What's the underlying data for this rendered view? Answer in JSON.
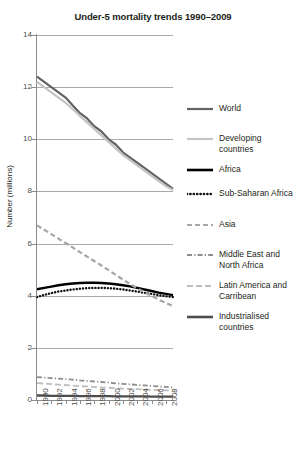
{
  "chart_data": {
    "type": "line",
    "title": "Under-5 mortality trends 1990–2009",
    "xlabel": "",
    "ylabel": "Number (millions)",
    "xlim": [
      1990,
      2009
    ],
    "ylim": [
      0,
      14
    ],
    "yticks": [
      0,
      2,
      4,
      6,
      8,
      10,
      12,
      14
    ],
    "xticks": [
      1990,
      1992,
      1994,
      1996,
      1998,
      2000,
      2002,
      2004,
      2006,
      2008
    ],
    "grid": "horizontal",
    "legend_position": "right",
    "x": [
      1990,
      1991,
      1992,
      1993,
      1994,
      1995,
      1996,
      1997,
      1998,
      1999,
      2000,
      2001,
      2002,
      2003,
      2004,
      2005,
      2006,
      2007,
      2008,
      2009
    ],
    "series": [
      {
        "name": "World",
        "style": "solid",
        "color": "#636363",
        "width": 2.2,
        "values": [
          12.4,
          12.2,
          12.0,
          11.8,
          11.6,
          11.3,
          11.0,
          10.8,
          10.5,
          10.3,
          10.0,
          9.8,
          9.5,
          9.3,
          9.1,
          8.9,
          8.7,
          8.5,
          8.3,
          8.1
        ]
      },
      {
        "name": "Developing countries",
        "style": "solid",
        "color": "#c4c4c4",
        "width": 2.2,
        "values": [
          12.2,
          12.0,
          11.8,
          11.6,
          11.4,
          11.15,
          10.9,
          10.65,
          10.4,
          10.15,
          9.9,
          9.65,
          9.4,
          9.2,
          9.0,
          8.8,
          8.6,
          8.4,
          8.2,
          8.05
        ]
      },
      {
        "name": "Africa",
        "style": "solid",
        "color": "#000000",
        "width": 2.4,
        "values": [
          4.25,
          4.3,
          4.35,
          4.4,
          4.44,
          4.47,
          4.49,
          4.5,
          4.5,
          4.49,
          4.47,
          4.44,
          4.4,
          4.36,
          4.3,
          4.24,
          4.18,
          4.12,
          4.07,
          4.02
        ]
      },
      {
        "name": "Sub-Saharan Africa",
        "style": "dotted",
        "color": "#111111",
        "width": 2.4,
        "values": [
          3.95,
          4.03,
          4.1,
          4.16,
          4.2,
          4.24,
          4.27,
          4.29,
          4.3,
          4.3,
          4.29,
          4.27,
          4.24,
          4.2,
          4.16,
          4.11,
          4.07,
          4.02,
          3.98,
          3.95
        ]
      },
      {
        "name": "Asia",
        "style": "dashed",
        "color": "#a6a6a6",
        "width": 2.2,
        "values": [
          6.7,
          6.53,
          6.36,
          6.19,
          6.02,
          5.85,
          5.67,
          5.5,
          5.33,
          5.16,
          4.98,
          4.8,
          4.62,
          4.45,
          4.28,
          4.13,
          3.99,
          3.85,
          3.72,
          3.6
        ]
      },
      {
        "name": "Middle East and North Africa",
        "style": "dashdot",
        "color": "#8c8c8c",
        "width": 1.8,
        "values": [
          0.88,
          0.86,
          0.84,
          0.82,
          0.8,
          0.78,
          0.75,
          0.73,
          0.71,
          0.69,
          0.67,
          0.64,
          0.62,
          0.6,
          0.58,
          0.56,
          0.54,
          0.52,
          0.5,
          0.48
        ]
      },
      {
        "name": "Latin America and Carribean",
        "style": "longdash",
        "color": "#bdbdbd",
        "width": 1.8,
        "values": [
          0.65,
          0.63,
          0.61,
          0.59,
          0.57,
          0.55,
          0.53,
          0.52,
          0.5,
          0.48,
          0.47,
          0.45,
          0.44,
          0.43,
          0.42,
          0.4,
          0.39,
          0.38,
          0.37,
          0.36
        ]
      },
      {
        "name": "Industrialised countries",
        "style": "solid",
        "color": "#4d4d4d",
        "width": 2.4,
        "values": [
          0.17,
          0.17,
          0.16,
          0.16,
          0.16,
          0.16,
          0.15,
          0.15,
          0.15,
          0.15,
          0.15,
          0.14,
          0.14,
          0.14,
          0.14,
          0.14,
          0.13,
          0.13,
          0.13,
          0.13
        ]
      }
    ]
  },
  "axes": {
    "y_title": "Number (millions)",
    "y_tick_labels": [
      "14",
      "12",
      "10",
      "8",
      "6",
      "4",
      "2",
      "0"
    ],
    "x_tick_labels": [
      "1990",
      "1992",
      "1994",
      "1996",
      "1998",
      "2000",
      "2002",
      "2004",
      "2006",
      "2008"
    ]
  },
  "legend": {
    "items": [
      {
        "label": "World",
        "style": "solid",
        "color": "#636363",
        "width": 2.2
      },
      {
        "label": "Developing\ncountries",
        "style": "solid",
        "color": "#c4c4c4",
        "width": 2.2
      },
      {
        "label": "Africa",
        "style": "solid",
        "color": "#000000",
        "width": 2.6
      },
      {
        "label": "Sub-Saharan Africa",
        "style": "dotted",
        "color": "#111111",
        "width": 2.6
      },
      {
        "label": "Asia",
        "style": "dashed",
        "color": "#a6a6a6",
        "width": 2.2
      },
      {
        "label": "Middle East and\nNorth Africa",
        "style": "dashdot",
        "color": "#8c8c8c",
        "width": 1.9
      },
      {
        "label": "Latin America and\nCarribean",
        "style": "longdash",
        "color": "#bdbdbd",
        "width": 1.9
      },
      {
        "label": "Industrialised\ncountries",
        "style": "solid",
        "color": "#4d4d4d",
        "width": 2.6
      }
    ]
  }
}
